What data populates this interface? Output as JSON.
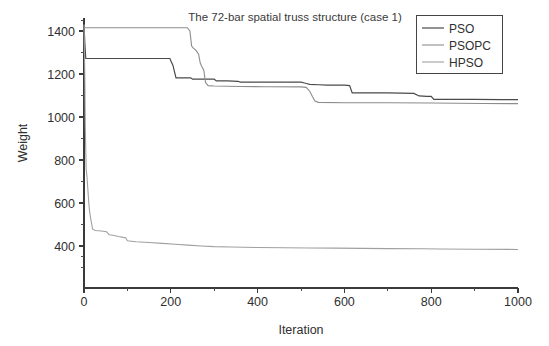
{
  "chart_data": {
    "type": "line",
    "title": "The 72-bar spatial truss structure (case 1)",
    "xlabel": "Iteration",
    "ylabel": "Weight",
    "xlim": [
      0,
      1000
    ],
    "ylim": [
      310,
      1460
    ],
    "grid": false,
    "legend_position": "top-right",
    "xticks": [
      0,
      200,
      400,
      600,
      800,
      1000
    ],
    "xtick_labels": [
      "0",
      "200",
      "400",
      "600",
      "800",
      "1000"
    ],
    "yticks": [
      400,
      600,
      800,
      1000,
      1200,
      1400
    ],
    "ytick_labels": [
      "400",
      "600",
      "800",
      "1000",
      "1200",
      "1400"
    ],
    "series": [
      {
        "name": "PSO",
        "color": "#4a4a4a",
        "width": 1.2,
        "points": [
          [
            0,
            1430
          ],
          [
            2,
            1340
          ],
          [
            4,
            1272
          ],
          [
            198,
            1272
          ],
          [
            200,
            1262
          ],
          [
            205,
            1240
          ],
          [
            208,
            1215
          ],
          [
            212,
            1182
          ],
          [
            246,
            1182
          ],
          [
            250,
            1176
          ],
          [
            300,
            1176
          ],
          [
            305,
            1168
          ],
          [
            330,
            1168
          ],
          [
            355,
            1166
          ],
          [
            360,
            1162
          ],
          [
            500,
            1162
          ],
          [
            508,
            1158
          ],
          [
            512,
            1156
          ],
          [
            520,
            1152
          ],
          [
            540,
            1150
          ],
          [
            560,
            1148
          ],
          [
            600,
            1148
          ],
          [
            612,
            1146
          ],
          [
            618,
            1112
          ],
          [
            700,
            1112
          ],
          [
            760,
            1110
          ],
          [
            772,
            1098
          ],
          [
            790,
            1096
          ],
          [
            800,
            1096
          ],
          [
            806,
            1082
          ],
          [
            860,
            1082
          ],
          [
            900,
            1082
          ],
          [
            960,
            1081
          ],
          [
            1000,
            1081
          ]
        ]
      },
      {
        "name": "PSOPC",
        "color": "#8c8c8c",
        "width": 1.1,
        "points": [
          [
            0,
            1415
          ],
          [
            238,
            1415
          ],
          [
            244,
            1400
          ],
          [
            248,
            1330
          ],
          [
            252,
            1320
          ],
          [
            258,
            1310
          ],
          [
            264,
            1292
          ],
          [
            268,
            1250
          ],
          [
            272,
            1232
          ],
          [
            276,
            1218
          ],
          [
            280,
            1160
          ],
          [
            286,
            1146
          ],
          [
            300,
            1144
          ],
          [
            360,
            1142
          ],
          [
            420,
            1141
          ],
          [
            500,
            1140
          ],
          [
            512,
            1138
          ],
          [
            520,
            1120
          ],
          [
            526,
            1096
          ],
          [
            532,
            1074
          ],
          [
            540,
            1068
          ],
          [
            600,
            1066
          ],
          [
            700,
            1066
          ],
          [
            800,
            1065
          ],
          [
            860,
            1064
          ],
          [
            920,
            1063
          ],
          [
            1000,
            1062
          ]
        ]
      },
      {
        "name": "HPSO",
        "color": "#a0a0a0",
        "width": 1.1,
        "points": [
          [
            0,
            1430
          ],
          [
            2,
            1180
          ],
          [
            3,
            950
          ],
          [
            5,
            760
          ],
          [
            7,
            718
          ],
          [
            9,
            660
          ],
          [
            11,
            600
          ],
          [
            13,
            560
          ],
          [
            16,
            520
          ],
          [
            20,
            478
          ],
          [
            26,
            472
          ],
          [
            40,
            470
          ],
          [
            52,
            466
          ],
          [
            58,
            452
          ],
          [
            66,
            450
          ],
          [
            72,
            448
          ],
          [
            80,
            444
          ],
          [
            90,
            440
          ],
          [
            96,
            438
          ],
          [
            100,
            424
          ],
          [
            120,
            420
          ],
          [
            150,
            416
          ],
          [
            180,
            412
          ],
          [
            210,
            408
          ],
          [
            240,
            404
          ],
          [
            270,
            400
          ],
          [
            300,
            397
          ],
          [
            340,
            395
          ],
          [
            400,
            393
          ],
          [
            460,
            392
          ],
          [
            520,
            391
          ],
          [
            580,
            390
          ],
          [
            640,
            389
          ],
          [
            700,
            388
          ],
          [
            780,
            387
          ],
          [
            820,
            386
          ],
          [
            900,
            385
          ],
          [
            1000,
            384
          ]
        ]
      }
    ]
  },
  "legend": {
    "entries": [
      {
        "label": "PSO"
      },
      {
        "label": "PSOPC"
      },
      {
        "label": "HPSO"
      }
    ]
  }
}
